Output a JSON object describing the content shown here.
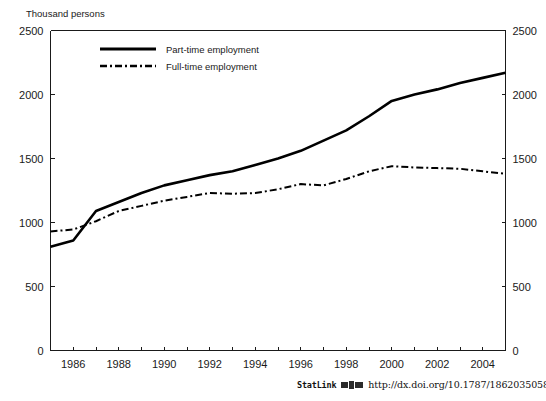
{
  "figure": {
    "y_axis_unit_label": "Thousand persons",
    "legend": [
      {
        "label": "Part-time employment",
        "style": "solid"
      },
      {
        "label": "Full-time employment",
        "style": "dash-dot"
      }
    ]
  },
  "statlink": {
    "word": "StatLink",
    "icon": "statlink-barcode-icon",
    "url": "http://dx.doi.org/10.1787/186203505807"
  },
  "chart_data": {
    "type": "line",
    "title": "",
    "subtitle": "",
    "xlabel": "",
    "ylabel": "Thousand persons",
    "xlim": [
      1985,
      2005
    ],
    "ylim": [
      0,
      2500
    ],
    "grid": false,
    "legend_position": "top-center",
    "y_ticks": [
      0,
      500,
      1000,
      1500,
      2000,
      2500
    ],
    "y_tick_labels": [
      "0",
      "500",
      "1000",
      "1500",
      "2000",
      "2500"
    ],
    "y_axis_both_sides": true,
    "x_ticks": [
      1985,
      1986,
      1987,
      1988,
      1989,
      1990,
      1991,
      1992,
      1993,
      1994,
      1995,
      1996,
      1997,
      1998,
      1999,
      2000,
      2001,
      2002,
      2003,
      2004,
      2005
    ],
    "x_tick_labels": [
      "",
      "1986",
      "",
      "1988",
      "",
      "1990",
      "",
      "1992",
      "",
      "1994",
      "",
      "1996",
      "",
      "1998",
      "",
      "2000",
      "",
      "2002",
      "",
      "2004",
      ""
    ],
    "x": [
      1985,
      1986,
      1987,
      1988,
      1989,
      1990,
      1991,
      1992,
      1993,
      1994,
      1995,
      1996,
      1997,
      1998,
      1999,
      2000,
      2001,
      2002,
      2003,
      2004,
      2005
    ],
    "series": [
      {
        "name": "Part-time employment",
        "style": "solid",
        "values": [
          810,
          860,
          1090,
          1160,
          1230,
          1290,
          1330,
          1370,
          1400,
          1450,
          1500,
          1560,
          1640,
          1720,
          1830,
          1950,
          2000,
          2040,
          2090,
          2130,
          2170
        ]
      },
      {
        "name": "Full-time employment",
        "style": "dash-dot",
        "values": [
          930,
          945,
          1010,
          1090,
          1130,
          1170,
          1200,
          1230,
          1225,
          1230,
          1260,
          1300,
          1290,
          1340,
          1400,
          1440,
          1430,
          1425,
          1420,
          1400,
          1380
        ]
      }
    ]
  }
}
